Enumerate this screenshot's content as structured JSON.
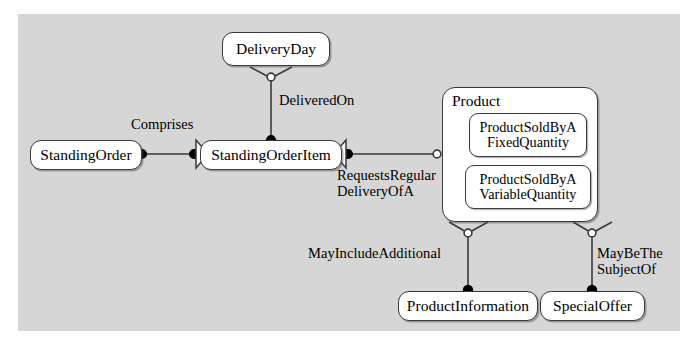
{
  "diagram": {
    "background_color": "#ffffff",
    "panel_color": "#d6d6d6",
    "node_fill": "#ffffff",
    "stroke_color": "#3a3a3a"
  },
  "nodes": {
    "standing_order": {
      "label": "StandingOrder"
    },
    "standing_order_item": {
      "label": "StandingOrderItem"
    },
    "delivery_day": {
      "label": "DeliveryDay"
    },
    "product": {
      "label": "Product"
    },
    "product_fixed": {
      "label": "ProductSoldByA\nFixedQuantity"
    },
    "product_variable": {
      "label": "ProductSoldByA\nVariableQuantity"
    },
    "product_information": {
      "label": "ProductInformation"
    },
    "special_offer": {
      "label": "SpecialOffer"
    }
  },
  "edges": {
    "comprises": {
      "label": "Comprises"
    },
    "delivered_on": {
      "label": "DeliveredOn"
    },
    "requests_regular_delivery": {
      "label": "RequestsRegular\nDeliveryOfA"
    },
    "may_include_additional": {
      "label": "MayIncludeAdditional"
    },
    "may_be_the_subject_of": {
      "label": "MayBeThe\nSubjectOf"
    }
  }
}
